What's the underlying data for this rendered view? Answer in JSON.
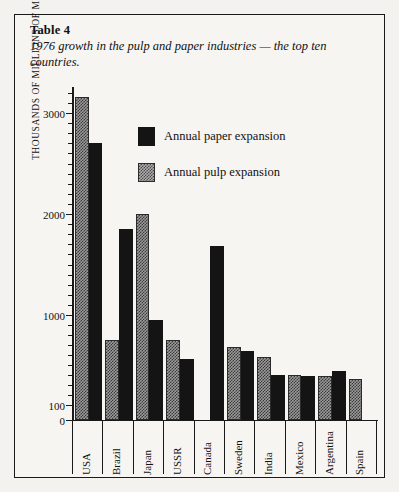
{
  "caption": {
    "table_label": "Table 4",
    "text": "1976 growth in the pulp and paper industries — the top ten countries."
  },
  "chart_data": {
    "type": "bar",
    "title": "1976 growth in the pulp and paper industries — the top ten countries.",
    "xlabel": "",
    "ylabel": "THOUSANDS OF MILLIONS OF METRIC TONS",
    "categories": [
      "USA",
      "Brazil",
      "Japan",
      "USSR",
      "Canada",
      "Sweden",
      "India",
      "Mexico",
      "Argentina",
      "Spain"
    ],
    "series": [
      {
        "name": "Annual pulp expansion",
        "color": "#9a9a9a",
        "fill": "stipple",
        "values": [
          3150,
          750,
          2000,
          750,
          0,
          680,
          580,
          400,
          390,
          360
        ]
      },
      {
        "name": "Annual paper expansion",
        "color": "#141414",
        "fill": "solid",
        "values": [
          2700,
          1850,
          950,
          560,
          1680,
          640,
          400,
          390,
          440,
          0
        ]
      }
    ],
    "ytick_values": [
      0,
      100,
      1000,
      2000,
      3000
    ],
    "ytick_labels": [
      "0",
      "100",
      "1000",
      "2000",
      "3000"
    ],
    "ylim": [
      0,
      3300
    ],
    "grid": false,
    "legend_position": "inside-top-center",
    "bar_order_in_group": [
      "Annual pulp expansion",
      "Annual paper expansion"
    ]
  },
  "legend": {
    "items": [
      {
        "label": "Annual paper expansion",
        "swatch": "paper"
      },
      {
        "label": "Annual pulp expansion",
        "swatch": "pulp"
      }
    ]
  },
  "axis": {
    "y_title": "THOUSANDS OF MILLIONS OF METRIC TONS"
  }
}
